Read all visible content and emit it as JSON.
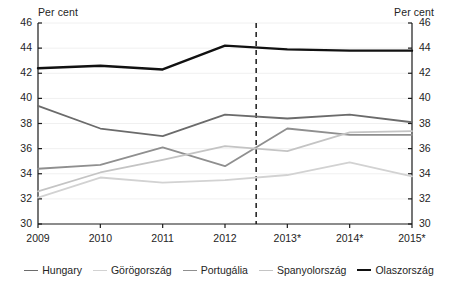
{
  "chart_data": {
    "type": "line",
    "title": "",
    "subtitle": "",
    "xlabel": "",
    "ylabel": "Per cent",
    "ylabel_right": "Per cent",
    "ylim": [
      30,
      46
    ],
    "ytick_step": 2,
    "yticks": [
      30,
      32,
      34,
      36,
      38,
      40,
      42,
      44,
      46
    ],
    "ytick_labels_left": [
      "30",
      "32",
      "34",
      "36",
      "38",
      "40",
      "42",
      "44",
      "46"
    ],
    "ytick_labels_right": [
      "30",
      "32",
      "34",
      "36",
      "38",
      "40",
      "42",
      "44",
      "46"
    ],
    "grid": true,
    "grid_axis": "y",
    "legend_position": "bottom",
    "categories": [
      "2009",
      "2010",
      "2011",
      "2012",
      "2013*",
      "2014*",
      "2015*"
    ],
    "x": [
      2009,
      2010,
      2011,
      2012,
      2013,
      2014,
      2015
    ],
    "annotations": [
      {
        "name": "forecast-divider",
        "type": "vline",
        "x_between": [
          "2012",
          "2013*"
        ],
        "x_value": 2012.5,
        "style": "dashed",
        "color": "#1a1a1a"
      }
    ],
    "series": [
      {
        "name": "Hungary",
        "color": "#6b6b6b",
        "width": 1.8,
        "values": [
          39.4,
          37.6,
          37.0,
          38.7,
          38.4,
          38.7,
          38.1
        ]
      },
      {
        "name": "Görögország",
        "color": "#d2d2d2",
        "width": 1.8,
        "values": [
          32.1,
          33.7,
          33.3,
          33.5,
          33.9,
          34.9,
          33.8
        ]
      },
      {
        "name": "Portugália",
        "color": "#8f8f8f",
        "width": 1.8,
        "values": [
          34.4,
          34.7,
          36.1,
          34.6,
          37.6,
          37.1,
          37.1
        ]
      },
      {
        "name": "Spanyolország",
        "color": "#c4c4c4",
        "width": 1.8,
        "values": [
          32.6,
          34.1,
          35.1,
          36.2,
          35.8,
          37.3,
          37.4
        ]
      },
      {
        "name": "Olaszország",
        "color": "#111111",
        "width": 2.4,
        "values": [
          42.4,
          42.6,
          42.3,
          44.2,
          43.9,
          43.8,
          43.8
        ]
      }
    ]
  },
  "legend": {
    "items": [
      {
        "label": "Hungary",
        "color": "#6b6b6b",
        "width": 1.8
      },
      {
        "label": "Görögország",
        "color": "#d2d2d2",
        "width": 1.8
      },
      {
        "label": "Portugália",
        "color": "#8f8f8f",
        "width": 1.8
      },
      {
        "label": "Spanyolország",
        "color": "#c4c4c4",
        "width": 1.8
      },
      {
        "label": "Olaszország",
        "color": "#111111",
        "width": 2.6
      }
    ]
  },
  "axes": {
    "left_title": "Per cent",
    "right_title": "Per cent"
  },
  "colors": {
    "background": "#ffffff",
    "axis": "#1a1a1a",
    "grid": "#f0f0f0",
    "text": "#242424"
  }
}
